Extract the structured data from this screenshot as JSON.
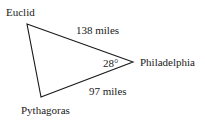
{
  "diagram": {
    "vertices": {
      "euclid": {
        "label": "Euclid",
        "x": 27,
        "y": 24
      },
      "philadelphia": {
        "label": "Philadelphia",
        "x": 133,
        "y": 62
      },
      "pythagoras": {
        "label": "Pythagoras",
        "x": 41,
        "y": 97
      }
    },
    "edges": {
      "euclid_philadelphia": {
        "label": "138 miles"
      },
      "pythagoras_philadelphia": {
        "label": "97 miles"
      }
    },
    "angle": {
      "label": "28°",
      "at": "Philadelphia"
    },
    "stroke_color": "#1a1a1a"
  }
}
